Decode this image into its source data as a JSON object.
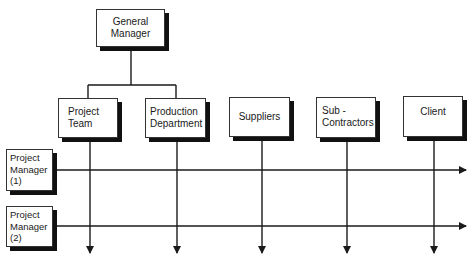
{
  "diagram": {
    "top": {
      "label_line1": "General",
      "label_line2": "Manager"
    },
    "departments": [
      {
        "line1": "Project",
        "line2": "Team"
      },
      {
        "line1": "Production",
        "line2": "Department"
      },
      {
        "line1": "Suppliers",
        "line2": ""
      },
      {
        "line1": "Sub -",
        "line2": "Contractors"
      },
      {
        "line1": "Client",
        "line2": ""
      }
    ],
    "managers": [
      {
        "line1": "Project",
        "line2": "Manager",
        "line3": "(1)"
      },
      {
        "line1": "Project",
        "line2": "Manager",
        "line3": "(2)"
      }
    ],
    "colors": {
      "line": "#1a1a1a",
      "shadow": "#111111",
      "box": "#ffffff"
    }
  }
}
